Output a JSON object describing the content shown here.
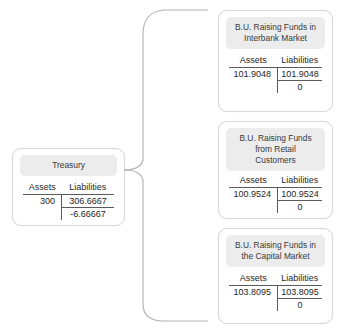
{
  "diagram": {
    "type": "balance-sheet-tree",
    "column_headers": {
      "assets": "Assets",
      "liabilities": "Liabilities"
    },
    "connector": {
      "name": "curly-brace",
      "color": "#b0b0b0"
    },
    "source": {
      "title": "Treasury",
      "assets": "300",
      "liabilities_1": "306.6667",
      "liabilities_2": "-6.66667"
    },
    "targets": [
      {
        "title_line1": "B.U. Raising Funds in",
        "title_line2": "Interbank Market",
        "title_line3": "",
        "assets": "101.9048",
        "liabilities_1": "101.9048",
        "liabilities_2": "0"
      },
      {
        "title_line1": "B.U. Raising Funds",
        "title_line2": "from Retail",
        "title_line3": "Customers",
        "assets": "100.9524",
        "liabilities_1": "100.9524",
        "liabilities_2": "0"
      },
      {
        "title_line1": "B.U. Raising Funds in",
        "title_line2": "the Capital Market",
        "title_line3": "",
        "assets": "103.8095",
        "liabilities_1": "103.8095",
        "liabilities_2": "0"
      }
    ]
  }
}
